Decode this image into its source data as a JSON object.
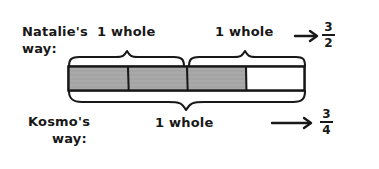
{
  "diagram": {
    "natalie": {
      "name_line1": "Natalie's",
      "name_line2": "way:",
      "brace_label_left": "1 whole",
      "brace_label_right": "1 whole",
      "arrow": "arrow-right",
      "result_numerator": "3",
      "result_denominator": "2",
      "result_text": "3/2"
    },
    "kosmo": {
      "name_line1": "Kosmo's",
      "name_line2": "way:",
      "brace_label": "1 whole",
      "arrow": "arrow-right",
      "result_numerator": "3",
      "result_denominator": "4",
      "result_text": "3/4"
    },
    "bar": {
      "total_cells": 4,
      "shaded_cells": 3,
      "cells": [
        {
          "index": 1,
          "state": "shaded"
        },
        {
          "index": 2,
          "state": "shaded"
        },
        {
          "index": 3,
          "state": "shaded"
        },
        {
          "index": 4,
          "state": "unshaded"
        }
      ]
    },
    "colors": {
      "ink": "#181818",
      "shaded_fill": "#a9a9a9",
      "unshaded_fill": "#ffffff",
      "background": "#ffffff"
    }
  }
}
